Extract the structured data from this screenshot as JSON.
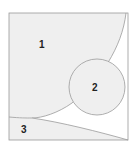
{
  "diagram": {
    "regions": [
      {
        "id": "region-1",
        "label": "1",
        "fill": "#efefef"
      },
      {
        "id": "region-2",
        "label": "2",
        "fill": "#efefef"
      },
      {
        "id": "region-3",
        "label": "3",
        "fill": "#efefef"
      }
    ],
    "colors": {
      "stroke": "#9a9a9a",
      "fill": "#efefef",
      "background": "#ffffff"
    }
  }
}
